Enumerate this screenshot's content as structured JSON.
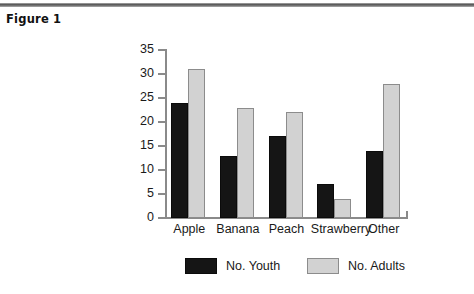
{
  "figure": {
    "caption": "Figure 1"
  },
  "chart_data": {
    "type": "bar",
    "title": "",
    "xlabel": "",
    "ylabel": "",
    "ylim": [
      0,
      35
    ],
    "ytick_step": 5,
    "yticks": [
      "0",
      "5",
      "10",
      "15",
      "20",
      "25",
      "30",
      "35"
    ],
    "grid": false,
    "legend_position": "bottom",
    "categories": [
      "Apple",
      "Banana",
      "Peach",
      "Strawberry",
      "Other"
    ],
    "series": [
      {
        "name": "No. Youth",
        "color": "#151515",
        "values": [
          24,
          13,
          17,
          7,
          14
        ]
      },
      {
        "name": "No. Adults",
        "color": "#d2d2d2",
        "values": [
          31,
          23,
          22,
          4,
          28
        ]
      }
    ]
  },
  "legend": {
    "items": [
      {
        "label": "No. Youth"
      },
      {
        "label": "No. Adults"
      }
    ]
  }
}
